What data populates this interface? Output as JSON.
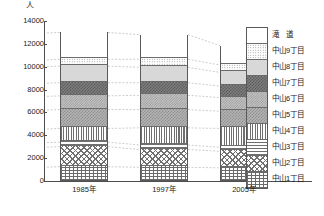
{
  "chart_data": {
    "type": "bar",
    "stacked": true,
    "title": "",
    "subtitle": "",
    "xlabel": "",
    "ylabel": "人",
    "unit_label": "人",
    "categories": [
      "1985年",
      "1997年",
      "2005年"
    ],
    "ylim": [
      0,
      14000
    ],
    "ytick_values": [
      0,
      2000,
      4000,
      6000,
      8000,
      10000,
      12000,
      14000
    ],
    "ytick_labels": [
      "0",
      "2000",
      "4000",
      "6000",
      "8000",
      "10000",
      "12000",
      "14000"
    ],
    "grid": false,
    "legend_position": "right",
    "connector_lines": true,
    "series": [
      {
        "name": "中山1丁目",
        "pattern": "brick",
        "values": [
          1250,
          1200,
          1150
        ]
      },
      {
        "name": "中山2丁目",
        "pattern": "diagonal-lattice",
        "values": [
          1750,
          1550,
          1450
        ]
      },
      {
        "name": "中山3丁目",
        "pattern": "horizontal-stripe",
        "values": [
          400,
          400,
          350
        ]
      },
      {
        "name": "中山4丁目",
        "pattern": "vertical-stripe",
        "values": [
          1200,
          1500,
          1650
        ]
      },
      {
        "name": "中山5丁目",
        "pattern": "checker-mid",
        "values": [
          1650,
          1600,
          1500
        ]
      },
      {
        "name": "中山6丁目",
        "pattern": "checker-mid2",
        "values": [
          1200,
          1250,
          1200
        ]
      },
      {
        "name": "中山7丁目",
        "pattern": "checker-dark",
        "values": [
          1150,
          1100,
          1000
        ]
      },
      {
        "name": "中山8丁目",
        "pattern": "solid-light",
        "values": [
          1450,
          1350,
          1200
        ]
      },
      {
        "name": "中山9丁目",
        "pattern": "dots-fine",
        "values": [
          600,
          700,
          650
        ]
      },
      {
        "name": "滝　道",
        "pattern": "dots-sparse",
        "values": [
          2350,
          2150,
          1700
        ]
      }
    ],
    "totals": [
      13000,
      12800,
      11850
    ]
  },
  "legend": {
    "entries": [
      {
        "label": "滝　道"
      },
      {
        "label": "中山9丁目"
      },
      {
        "label": "中山8丁目"
      },
      {
        "label": "中山7丁目"
      },
      {
        "label": "中山6丁目"
      },
      {
        "label": "中山5丁目"
      },
      {
        "label": "中山4丁目"
      },
      {
        "label": "中山3丁目"
      },
      {
        "label": "中山2丁目"
      },
      {
        "label": "中山1丁目"
      }
    ]
  },
  "colors": {
    "axis": "#4d4d4d",
    "segment_border": "#6b6b6b",
    "bar_border": "#5a5a5a",
    "connector": "#9a9a9a",
    "text": "#1a1a1a",
    "background": "#ffffff"
  }
}
